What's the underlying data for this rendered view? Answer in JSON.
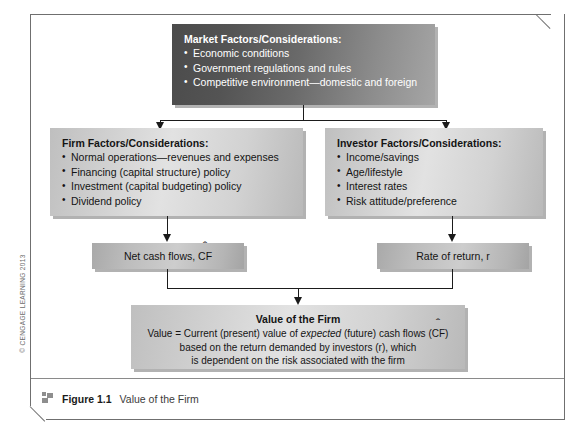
{
  "figure": {
    "number_label": "Figure 1.1",
    "caption": "Value of the Firm",
    "copyright": "© CENGAGE LEARNING 2013"
  },
  "boxes": {
    "market": {
      "title": "Market Factors/Considerations:",
      "items": [
        "Economic conditions",
        "Government regulations and rules",
        "Competitive environment—domestic and foreign"
      ]
    },
    "firm": {
      "title": "Firm Factors/Considerations:",
      "items": [
        "Normal operations—revenues and expenses",
        "Financing (capital structure) policy",
        "Investment (capital budgeting) policy",
        "Dividend policy"
      ]
    },
    "investor": {
      "title": "Investor Factors/Considerations:",
      "items": [
        "Income/savings",
        "Age/lifestyle",
        "Interest rates",
        "Risk attitude/preference"
      ]
    },
    "net_cash_flows": {
      "prefix": "Net cash flows, ",
      "symbol": "CF"
    },
    "rate_of_return": {
      "label": "Rate of return, r"
    },
    "value_of_firm": {
      "heading": "Value of the Firm",
      "line1_a": "Value = Current (present) value of ",
      "line1_italic": "expected",
      "line1_b": " (future) cash flows (",
      "line1_symbol": "CF",
      "line1_c": ")",
      "line2": "based on the return demanded by investors (r), which",
      "line3": "is dependent on the risk associated with the firm"
    }
  },
  "colors": {
    "dark_box_start": "#4b4b4b",
    "dark_box_end": "#a6a6a6",
    "light_box": "#d9d9d9",
    "band_box": "#bdbdbd",
    "connector": "#1b1b1b",
    "frame": "#6f6f6f",
    "caption_marker": "#8e8e8e"
  }
}
